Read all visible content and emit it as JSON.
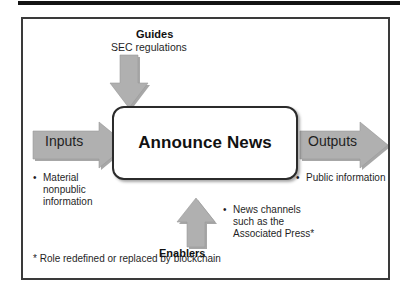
{
  "figure": {
    "type": "idef0-process-diagram",
    "process": {
      "label": "Announce News"
    },
    "top_rule_color": "#141414",
    "frame_border_color": "#3a3a3a",
    "arrow_fill_color": "#b0b0b0",
    "arrow_shadow_color": "#3c3c3c"
  },
  "guides": {
    "title": "Guides",
    "detail": "SEC regulations",
    "arrow_direction": "down"
  },
  "inputs": {
    "label": "Inputs",
    "arrow_direction": "right",
    "bullets": [
      {
        "marker": "•",
        "lines": [
          "Material",
          "nonpublic",
          "information"
        ]
      }
    ]
  },
  "outputs": {
    "label": "Outputs",
    "arrow_direction": "right",
    "bullets": [
      {
        "marker": "•",
        "lines": [
          "Public information"
        ]
      }
    ]
  },
  "enablers": {
    "label": "Enablers",
    "arrow_direction": "up",
    "bullets": [
      {
        "marker": "•",
        "lines": [
          "News channels",
          "such as the",
          "Associated Press*"
        ]
      }
    ]
  },
  "footnote": {
    "text": "* Role redefined or replaced by blockchain"
  }
}
